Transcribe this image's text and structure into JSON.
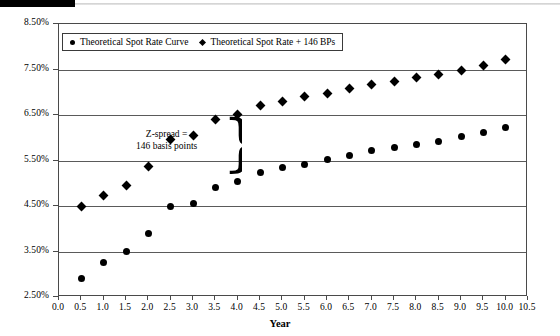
{
  "figure": {
    "axis_title_x": "Year",
    "legend": [
      {
        "marker": "circle-marker",
        "label": "Theoretical Spot Rate Curve"
      },
      {
        "marker": "diamond-marker",
        "label": "Theoretical Spot Rate + 146 BPs"
      }
    ],
    "annotation": {
      "line1": "Z-spread =",
      "line2": "146 basis points",
      "brace": "}"
    }
  },
  "chart_data": {
    "type": "scatter",
    "title": "",
    "xlabel": "Year",
    "ylabel": "",
    "xlim": [
      0.0,
      10.5
    ],
    "ylim": [
      2.5,
      8.5
    ],
    "xticks": [
      "0.0",
      "0.5",
      "1.0",
      "1.5",
      "2.0",
      "2.5",
      "3.0",
      "3.5",
      "4.0",
      "4.5",
      "5.0",
      "5.5",
      "6.0",
      "6.5",
      "7.0",
      "7.5",
      "8.0",
      "8.5",
      "9.0",
      "9.5",
      "10.0",
      "10.5"
    ],
    "yticks": [
      "2.50%",
      "3.50%",
      "4.50%",
      "5.50%",
      "6.50%",
      "7.50%",
      "8.50%"
    ],
    "grid": true,
    "legend_position": "top-left-inside",
    "x": [
      0.5,
      1.0,
      1.5,
      2.0,
      2.5,
      3.0,
      3.5,
      4.0,
      4.5,
      5.0,
      5.5,
      6.0,
      6.5,
      7.0,
      7.5,
      8.0,
      8.5,
      9.0,
      9.5,
      10.0
    ],
    "series": [
      {
        "name": "Theoretical Spot Rate Curve",
        "marker": "circle",
        "values": [
          2.9,
          3.26,
          3.5,
          3.9,
          4.48,
          4.56,
          4.9,
          5.04,
          5.24,
          5.34,
          5.42,
          5.52,
          5.62,
          5.72,
          5.78,
          5.86,
          5.92,
          6.02,
          6.12,
          6.22
        ]
      },
      {
        "name": "Theoretical Spot Rate + 146 BPs",
        "marker": "diamond",
        "values": [
          4.48,
          4.74,
          4.96,
          5.36,
          5.96,
          6.04,
          6.4,
          6.52,
          6.7,
          6.8,
          6.9,
          6.98,
          7.08,
          7.18,
          7.24,
          7.32,
          7.38,
          7.48,
          7.58,
          7.72
        ]
      }
    ]
  }
}
